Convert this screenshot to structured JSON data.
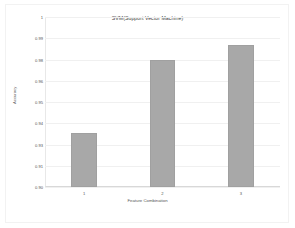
{
  "chart_data": {
    "type": "bar",
    "title": "SVM(Support Vector Machine)",
    "xlabel": "Feature Combination",
    "ylabel": "Accuracy",
    "categories": [
      "1",
      "2",
      "3"
    ],
    "values": [
      0.9315,
      0.975,
      0.9838
    ],
    "ylim": [
      0.9,
      1.0
    ],
    "yticks": [
      0.9,
      0.9125,
      0.925,
      0.9375,
      0.95,
      0.9625,
      0.975,
      0.9875,
      1.0
    ],
    "ytick_labels": [
      "0.90",
      "0.91",
      "0.93",
      "0.94",
      "0.95",
      "0.96",
      "0.98",
      "0.99",
      "1"
    ],
    "grid": true,
    "legend": "none",
    "bar_color": "#a8a8a8",
    "background_color": "#ffffff",
    "gridline_color": "#f0f0f0"
  }
}
